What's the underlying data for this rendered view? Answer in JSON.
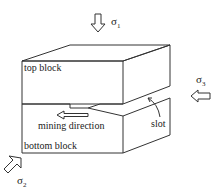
{
  "diagram": {
    "labels": {
      "top_block": "top block",
      "bottom_block": "bottom block",
      "mining_direction": "mining direction",
      "slot": "slot"
    },
    "stresses": {
      "sigma1": {
        "symbol": "σ",
        "sub": "1",
        "direction": "down"
      },
      "sigma2": {
        "symbol": "σ",
        "sub": "2",
        "direction": "diagonal-in"
      },
      "sigma3": {
        "symbol": "σ",
        "sub": "3",
        "direction": "left"
      }
    },
    "colors": {
      "line": "#333333",
      "background": "#ffffff"
    }
  }
}
